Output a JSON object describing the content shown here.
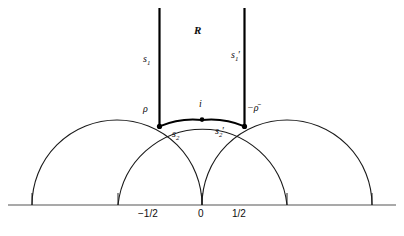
{
  "figure": {
    "caption": "",
    "colors": {
      "stroke": "#1a1a1a",
      "bold_stroke": "#000000",
      "axis": "#555555",
      "background": "#ffffff",
      "vertex": "#000000"
    },
    "region_label": "R",
    "vertical_sides": [
      {
        "name": "left-side",
        "label_base": "s",
        "label_sub": "1",
        "label_prime": "",
        "x": -0.5
      },
      {
        "name": "right-side",
        "label_base": "s",
        "label_sub": "1",
        "label_prime": "′",
        "x": 0.5
      }
    ],
    "arc_sides": [
      {
        "name": "left-arc",
        "label_base": "s",
        "label_sub": "2",
        "label_prime": ""
      },
      {
        "name": "right-arc",
        "label_base": "s",
        "label_sub": "2",
        "label_prime": "′"
      }
    ],
    "points": [
      {
        "name": "rho",
        "label": "ρ",
        "x": -0.5,
        "y": 0.866
      },
      {
        "name": "i",
        "label": "i",
        "x": 0.0,
        "y": 1.0
      },
      {
        "name": "minus-rho-bar",
        "label": "−ρ̄",
        "x": 0.5,
        "y": 0.866
      }
    ],
    "axis": {
      "name": "real-axis",
      "ticks": [
        {
          "label": "−1/2",
          "x": -0.5
        },
        {
          "label": "0",
          "x": 0.0
        },
        {
          "label": "1/2",
          "x": 0.5
        }
      ],
      "tick_marks_x": [
        -1.5,
        -0.5,
        0.0,
        0.5,
        1.5
      ]
    },
    "semicircles": [
      {
        "name": "semicircle-minus-one",
        "center": -1.0,
        "radius": 1.0
      },
      {
        "name": "semicircle-zero",
        "center": 0.0,
        "radius": 1.0
      },
      {
        "name": "semicircle-plus-one",
        "center": 1.0,
        "radius": 1.0
      }
    ]
  }
}
